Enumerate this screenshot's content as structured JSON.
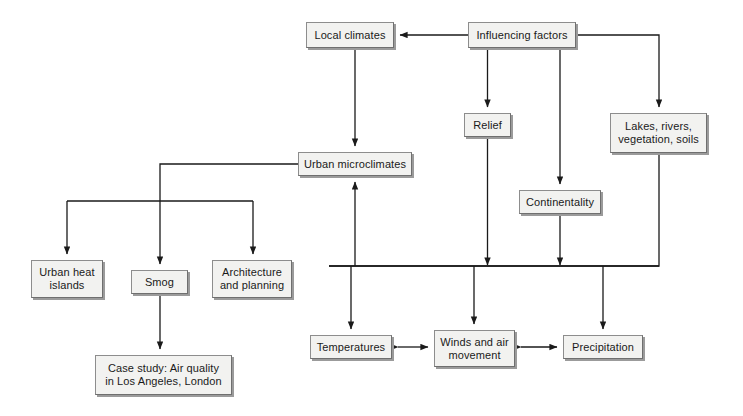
{
  "diagram": {
    "type": "flowchart",
    "canvas": {
      "width": 743,
      "height": 416
    },
    "style": {
      "background": "#ffffff",
      "node_fill": "#f2f2f0",
      "node_border": "#8d8d8d",
      "node_shadow": "#9b9b9b",
      "edge_color": "#1a1a1a",
      "text_color": "#1a1a1a"
    },
    "nodes": [
      {
        "id": "local-climates",
        "label": "Local climates",
        "x": 306,
        "y": 22,
        "w": 88,
        "h": 26
      },
      {
        "id": "influencing-factors",
        "label": "Influencing factors",
        "x": 468,
        "y": 22,
        "w": 108,
        "h": 26
      },
      {
        "id": "relief",
        "label": "Relief",
        "x": 464,
        "y": 113,
        "w": 47,
        "h": 24
      },
      {
        "id": "lakes-rivers-vegetation-soils",
        "label": "Lakes, rivers,\nvegetation, soils",
        "x": 610,
        "y": 113,
        "w": 97,
        "h": 40
      },
      {
        "id": "urban-microclimates",
        "label": "Urban microclimates",
        "x": 298,
        "y": 152,
        "w": 114,
        "h": 24
      },
      {
        "id": "continentality",
        "label": "Continentality",
        "x": 519,
        "y": 190,
        "w": 82,
        "h": 24
      },
      {
        "id": "urban-heat-islands",
        "label": "Urban heat\nislands",
        "x": 31,
        "y": 260,
        "w": 72,
        "h": 38
      },
      {
        "id": "smog",
        "label": "Smog",
        "x": 131,
        "y": 270,
        "w": 57,
        "h": 24
      },
      {
        "id": "architecture-and-planning",
        "label": "Architecture\nand planning",
        "x": 212,
        "y": 260,
        "w": 80,
        "h": 38
      },
      {
        "id": "temperatures",
        "label": "Temperatures",
        "x": 310,
        "y": 335,
        "w": 82,
        "h": 24
      },
      {
        "id": "winds-and-air-movement",
        "label": "Winds and air\nmovement",
        "x": 434,
        "y": 330,
        "w": 81,
        "h": 37
      },
      {
        "id": "precipitation",
        "label": "Precipitation",
        "x": 563,
        "y": 335,
        "w": 80,
        "h": 24
      },
      {
        "id": "case-study",
        "label": "Case study: Air quality\nin Los Angeles, London",
        "x": 95,
        "y": 355,
        "w": 137,
        "h": 40
      }
    ],
    "edges": [
      {
        "from": "influencing-factors",
        "to": "local-climates",
        "kind": "arrow"
      },
      {
        "from": "local-climates",
        "to": "urban-microclimates",
        "kind": "arrow"
      },
      {
        "from": "influencing-factors",
        "to": "relief",
        "kind": "arrow"
      },
      {
        "from": "influencing-factors",
        "to": "continentality",
        "kind": "arrow"
      },
      {
        "from": "influencing-factors",
        "to": "lakes-rivers-vegetation-soils",
        "kind": "arrow"
      },
      {
        "from": "relief",
        "to": "bus",
        "kind": "arrow"
      },
      {
        "from": "continentality",
        "to": "bus",
        "kind": "arrow"
      },
      {
        "from": "lakes-rivers-vegetation-soils",
        "to": "bus",
        "kind": "line"
      },
      {
        "from": "bus",
        "to": "urban-microclimates",
        "kind": "arrow"
      },
      {
        "from": "bus",
        "to": "temperatures",
        "kind": "arrow"
      },
      {
        "from": "bus",
        "to": "winds-and-air-movement",
        "kind": "arrow"
      },
      {
        "from": "bus",
        "to": "precipitation",
        "kind": "arrow"
      },
      {
        "from": "urban-microclimates",
        "to": "urban-heat-islands",
        "kind": "arrow"
      },
      {
        "from": "urban-microclimates",
        "to": "smog",
        "kind": "arrow"
      },
      {
        "from": "urban-microclimates",
        "to": "architecture-and-planning",
        "kind": "arrow"
      },
      {
        "from": "smog",
        "to": "case-study",
        "kind": "arrow"
      },
      {
        "from": "temperatures",
        "to": "winds-and-air-movement",
        "kind": "double-arrow"
      },
      {
        "from": "winds-and-air-movement",
        "to": "precipitation",
        "kind": "double-arrow"
      }
    ]
  }
}
